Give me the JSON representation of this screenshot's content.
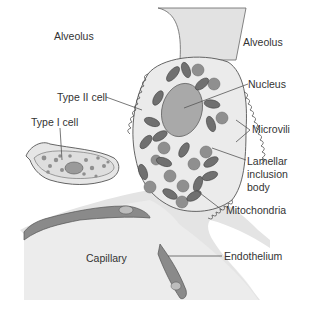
{
  "diagram": {
    "colors": {
      "background": "#ffffff",
      "interstitium": "#e4e4e4",
      "cell_fill": "#e9e9e9",
      "cell_outline": "#555555",
      "organelle_fill": "#8f8f8f",
      "organelle_dark": "#6e6e6e",
      "nucleus_fill": "#a8a8a8",
      "endothelium_fill": "#8a8a8a",
      "capillary_fill": "#ececec",
      "leader_line": "#555555",
      "text": "#333333"
    },
    "labels": {
      "alveolus_left": "Alveolus",
      "alveolus_right": "Alveolus",
      "type2_cell": "Type II cell",
      "type1_cell": "Type I cell",
      "nucleus": "Nucleus",
      "microvili": "Microvili",
      "lamellar_inclusion_body": "Lamellar\ninclusion\nbody",
      "mitochondria": "Mitochondria",
      "capillary": "Capillary",
      "endothelium": "Endothelium"
    }
  }
}
